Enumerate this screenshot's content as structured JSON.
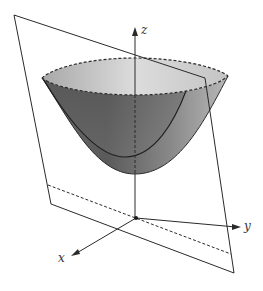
{
  "figure": {
    "axes": {
      "x_label": "x",
      "y_label": "y",
      "z_label": "z"
    },
    "colors": {
      "stroke": "#2a2a2a",
      "surface_dark": "#5a5a5a",
      "surface_mid": "#8c8c8c",
      "surface_light": "#c8c8c8",
      "rim_fill": "#d9d9d9",
      "background": "#ffffff"
    },
    "elements": [
      "paraboloid-surface",
      "paraboloid-rim-ellipse",
      "intersection-curve",
      "oblique-plane",
      "plane-dashed-trace",
      "x-axis",
      "y-axis",
      "z-axis",
      "origin-point"
    ]
  }
}
